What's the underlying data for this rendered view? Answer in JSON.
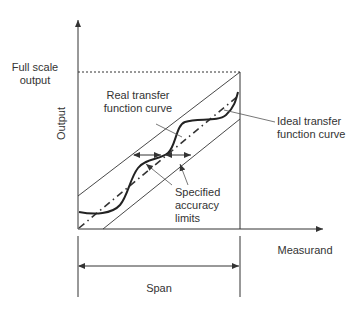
{
  "diagram": {
    "type": "sensor transfer function / accuracy diagram",
    "labels": {
      "full_scale_line1": "Full scale",
      "full_scale_line2": "output",
      "y_axis": "Output",
      "x_axis": "Measurand",
      "span": "Span",
      "real_curve_line1": "Real transfer",
      "real_curve_line2": "function curve",
      "ideal_curve_line1": "Ideal transfer",
      "ideal_curve_line2": "function curve",
      "limits_line1": "Specified",
      "limits_line2": "accuracy",
      "limits_line3": "limits"
    },
    "colors": {
      "line": "#333333",
      "text": "#333333",
      "background": "#ffffff"
    }
  }
}
